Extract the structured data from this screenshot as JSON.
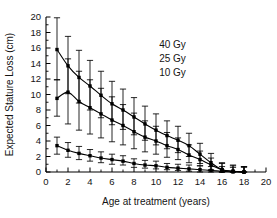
{
  "chart_data": {
    "type": "line",
    "title": "",
    "xlabel": "Age at treatment (years)",
    "ylabel": "Expected Stature Loss (cm)",
    "xlim": [
      0,
      20
    ],
    "ylim": [
      0,
      20
    ],
    "xticks": [
      0,
      2,
      4,
      6,
      8,
      10,
      12,
      14,
      16,
      18,
      20
    ],
    "yticks": [
      0,
      2,
      4,
      6,
      8,
      10,
      12,
      14,
      16,
      18,
      20
    ],
    "xtick_labels": [
      "0",
      "2",
      "4",
      "6",
      "8",
      "10",
      "12",
      "14",
      "16",
      "18",
      "20"
    ],
    "ytick_labels": [
      "0",
      "2",
      "4",
      "6",
      "8",
      "10",
      "12",
      "14",
      "16",
      "18",
      "20"
    ],
    "minor_ticks": true,
    "grid": false,
    "legend_position": "upper-right-inside",
    "error_bars": "vertical",
    "marker": "square",
    "x": [
      1,
      2,
      3,
      4,
      5,
      6,
      7,
      8,
      9,
      10,
      11,
      12,
      13,
      14,
      15,
      16,
      17,
      18
    ],
    "series": [
      {
        "name": "40 Gy",
        "values": [
          15.8,
          13.7,
          12.2,
          11.1,
          9.9,
          8.8,
          8.0,
          7.1,
          6.2,
          5.4,
          4.7,
          4.1,
          3.4,
          2.3,
          1.2,
          0.3,
          0.1,
          0.0
        ],
        "err_low": [
          3.9,
          3.6,
          3.3,
          3.1,
          2.9,
          2.7,
          2.5,
          2.3,
          2.1,
          1.9,
          1.7,
          1.6,
          1.4,
          1.2,
          1.0,
          0.3,
          0.1,
          0.0
        ],
        "err_high": [
          4.1,
          3.8,
          3.5,
          3.3,
          3.1,
          2.9,
          2.7,
          2.5,
          2.3,
          2.1,
          1.9,
          1.8,
          1.6,
          1.4,
          1.2,
          0.9,
          0.8,
          0.7
        ]
      },
      {
        "name": "25 Gy",
        "values": [
          9.5,
          10.3,
          9.1,
          8.3,
          7.5,
          6.7,
          6.0,
          5.2,
          4.5,
          4.0,
          3.4,
          2.9,
          2.2,
          1.6,
          0.9,
          0.3,
          0.1,
          0.0
        ],
        "err_low": [
          2.3,
          4.1,
          3.7,
          3.4,
          3.1,
          2.8,
          2.5,
          2.2,
          1.9,
          1.7,
          1.5,
          1.3,
          1.0,
          0.8,
          0.6,
          0.3,
          0.1,
          0.0
        ],
        "err_high": [
          2.4,
          4.3,
          3.9,
          3.6,
          3.3,
          3.0,
          2.7,
          2.4,
          2.1,
          1.9,
          1.7,
          1.5,
          1.3,
          1.1,
          0.9,
          0.8,
          0.7,
          0.7
        ]
      },
      {
        "name": "10 Gy",
        "values": [
          3.4,
          2.8,
          2.4,
          2.1,
          1.8,
          1.6,
          1.4,
          1.1,
          0.9,
          0.8,
          0.6,
          0.5,
          0.4,
          0.3,
          0.2,
          0.1,
          0.0,
          0.0
        ],
        "err_low": [
          1.1,
          0.9,
          0.8,
          0.7,
          0.6,
          0.6,
          0.5,
          0.5,
          0.4,
          0.4,
          0.3,
          0.3,
          0.3,
          0.3,
          0.2,
          0.1,
          0.0,
          0.0
        ],
        "err_high": [
          1.1,
          1.0,
          0.9,
          0.8,
          0.8,
          0.7,
          0.7,
          0.6,
          0.6,
          0.6,
          0.5,
          0.5,
          0.5,
          0.5,
          0.5,
          0.6,
          0.6,
          0.6
        ]
      }
    ],
    "annotations": [
      {
        "text": "40 Gy",
        "x": 11.5,
        "y": 16.0
      },
      {
        "text": "25 Gy",
        "x": 11.5,
        "y": 14.2
      },
      {
        "text": "10 Gy",
        "x": 11.5,
        "y": 12.4
      }
    ]
  },
  "colors": {
    "axis": "#000000",
    "curve": "#000000",
    "background": "#ffffff",
    "text": "#141414"
  }
}
